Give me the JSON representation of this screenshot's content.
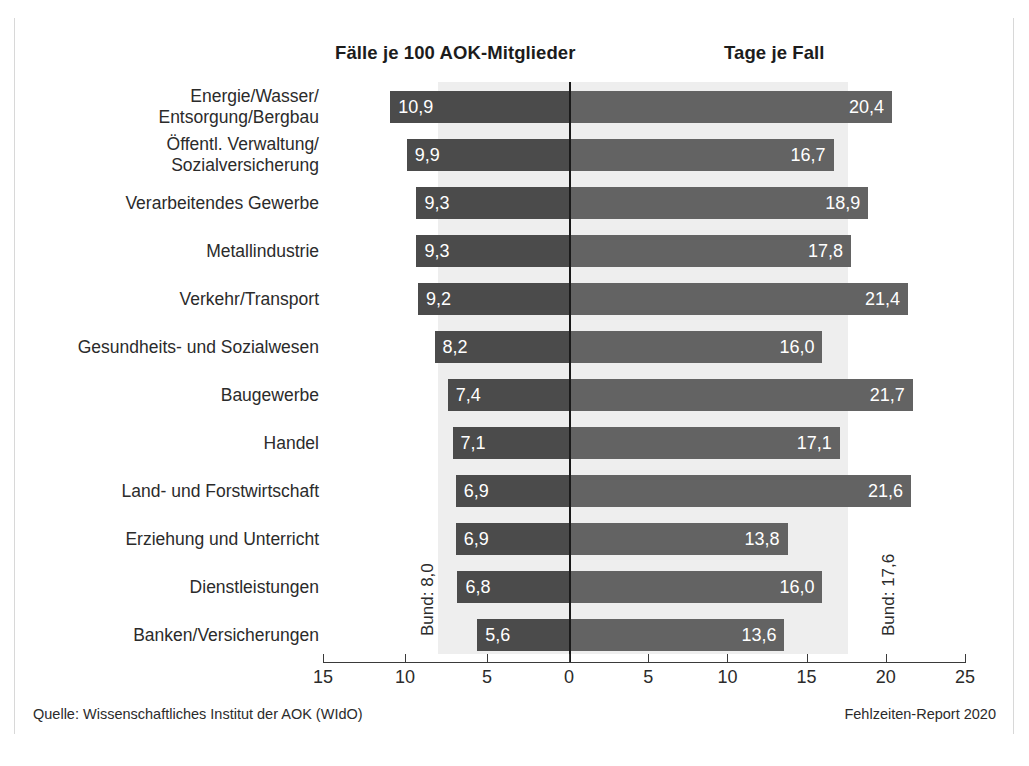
{
  "headers": {
    "left": "Fälle je 100 AOK-Mitglieder",
    "right": "Tage je Fall"
  },
  "reference": {
    "left_label": "Bund: 8,0",
    "right_label": "Bund: 17,6",
    "left_value": 8.0,
    "right_value": 17.6
  },
  "footer": {
    "source": "Quelle: Wissenschaftliches Institut der AOK (WIdO)",
    "report": "Fehlzeiten-Report 2020"
  },
  "colors": {
    "bar_left": "#4b4b4b",
    "bar_right": "#636363",
    "band": "#eeeeee",
    "zero_line": "#1a1a1a",
    "text": "#2b2b2b"
  },
  "chart_data": {
    "type": "bar",
    "title": "",
    "orientation": "horizontal",
    "layout": "diverging-butterfly",
    "grid": false,
    "legend": null,
    "categories": [
      "Energie/Wasser/\nEntsorgung/Bergbau",
      "Öffentl. Verwaltung/\nSozialversicherung",
      "Verarbeitendes Gewerbe",
      "Metallindustrie",
      "Verkehr/Transport",
      "Gesundheits- und Sozialwesen",
      "Baugewerbe",
      "Handel",
      "Land- und Forstwirtschaft",
      "Erziehung und Unterricht",
      "Dienstleistungen",
      "Banken/Versicherungen"
    ],
    "series": [
      {
        "name": "Fälle je 100 AOK-Mitglieder",
        "side": "left",
        "axis_direction": "reversed",
        "xlim": [
          0,
          15
        ],
        "ticks": [
          15,
          10,
          5,
          0
        ],
        "tick_labels": [
          "15",
          "10",
          "5",
          "0"
        ],
        "values": [
          10.9,
          9.9,
          9.3,
          9.3,
          9.2,
          8.2,
          7.4,
          7.1,
          6.9,
          6.9,
          6.8,
          5.6
        ],
        "value_labels": [
          "10,9",
          "9,9",
          "9,3",
          "9,3",
          "9,2",
          "8,2",
          "7,4",
          "7,1",
          "6,9",
          "6,9",
          "6,8",
          "5,6"
        ],
        "reference_line": 8.0
      },
      {
        "name": "Tage je Fall",
        "side": "right",
        "axis_direction": "normal",
        "xlim": [
          0,
          25
        ],
        "ticks": [
          0,
          5,
          10,
          15,
          20,
          25
        ],
        "tick_labels": [
          "0",
          "5",
          "10",
          "15",
          "20",
          "25"
        ],
        "values": [
          20.4,
          16.7,
          18.9,
          17.8,
          21.4,
          16.0,
          21.7,
          17.1,
          21.6,
          13.8,
          16.0,
          13.6
        ],
        "value_labels": [
          "20,4",
          "16,7",
          "18,9",
          "17,8",
          "21,4",
          "16,0",
          "21,7",
          "17,1",
          "21,6",
          "13,8",
          "16,0",
          "13,6"
        ],
        "reference_line": 17.6
      }
    ]
  }
}
